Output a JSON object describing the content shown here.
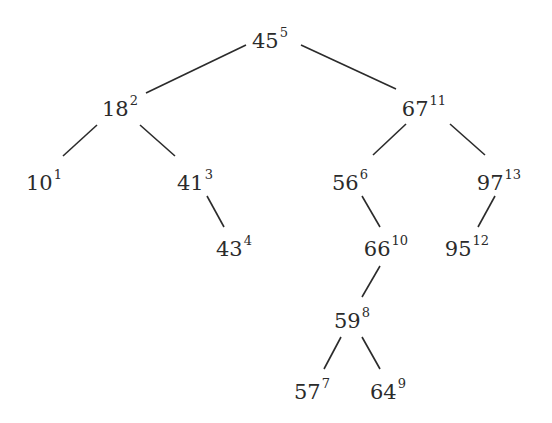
{
  "diagram": {
    "type": "binary-search-tree",
    "nodes": [
      {
        "id": "n45",
        "key": "45",
        "order": "5",
        "x": 270,
        "y": 40
      },
      {
        "id": "n18",
        "key": "18",
        "order": "2",
        "x": 120,
        "y": 108
      },
      {
        "id": "n67",
        "key": "67",
        "order": "11",
        "x": 424,
        "y": 108
      },
      {
        "id": "n10",
        "key": "10",
        "order": "1",
        "x": 44,
        "y": 182
      },
      {
        "id": "n41",
        "key": "41",
        "order": "3",
        "x": 195,
        "y": 182
      },
      {
        "id": "n56",
        "key": "56",
        "order": "6",
        "x": 350,
        "y": 182
      },
      {
        "id": "n97",
        "key": "97",
        "order": "13",
        "x": 499,
        "y": 182
      },
      {
        "id": "n43",
        "key": "43",
        "order": "4",
        "x": 234,
        "y": 248
      },
      {
        "id": "n66",
        "key": "66",
        "order": "10",
        "x": 386,
        "y": 248
      },
      {
        "id": "n95",
        "key": "95",
        "order": "12",
        "x": 467,
        "y": 248
      },
      {
        "id": "n59",
        "key": "59",
        "order": "8",
        "x": 352,
        "y": 320
      },
      {
        "id": "n57",
        "key": "57",
        "order": "7",
        "x": 312,
        "y": 391
      },
      {
        "id": "n64",
        "key": "64",
        "order": "9",
        "x": 388,
        "y": 391
      }
    ],
    "edges": [
      {
        "from": "n45",
        "to": "n18",
        "x1": 246,
        "y1": 45,
        "x2": 146,
        "y2": 93
      },
      {
        "from": "n45",
        "to": "n67",
        "x1": 301,
        "y1": 45,
        "x2": 396,
        "y2": 89
      },
      {
        "from": "n18",
        "to": "n10",
        "x1": 97,
        "y1": 125,
        "x2": 63,
        "y2": 156
      },
      {
        "from": "n18",
        "to": "n41",
        "x1": 140,
        "y1": 125,
        "x2": 175,
        "y2": 156
      },
      {
        "from": "n67",
        "to": "n56",
        "x1": 406,
        "y1": 124,
        "x2": 373,
        "y2": 155
      },
      {
        "from": "n67",
        "to": "n97",
        "x1": 450,
        "y1": 124,
        "x2": 485,
        "y2": 155
      },
      {
        "from": "n41",
        "to": "n43",
        "x1": 207,
        "y1": 196,
        "x2": 224,
        "y2": 227
      },
      {
        "from": "n56",
        "to": "n66",
        "x1": 362,
        "y1": 196,
        "x2": 380,
        "y2": 227
      },
      {
        "from": "n97",
        "to": "n95",
        "x1": 495,
        "y1": 196,
        "x2": 478,
        "y2": 227
      },
      {
        "from": "n66",
        "to": "n59",
        "x1": 380,
        "y1": 266,
        "x2": 362,
        "y2": 297
      },
      {
        "from": "n59",
        "to": "n57",
        "x1": 341,
        "y1": 337,
        "x2": 324,
        "y2": 369
      },
      {
        "from": "n59",
        "to": "n64",
        "x1": 362,
        "y1": 337,
        "x2": 380,
        "y2": 369
      }
    ]
  }
}
